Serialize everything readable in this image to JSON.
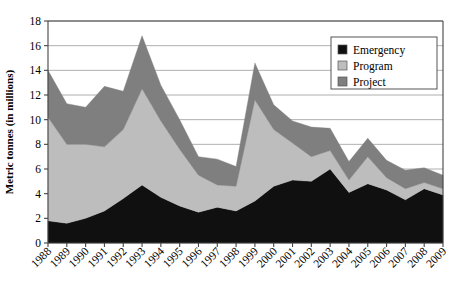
{
  "chart_data": {
    "type": "area",
    "stacked": true,
    "title": "",
    "xlabel": "",
    "ylabel": "Metric tonnes (in millions)",
    "ylim": [
      0,
      18
    ],
    "ytick_step": 2,
    "yticks": [
      "0",
      "2",
      "4",
      "6",
      "8",
      "10",
      "12",
      "14",
      "16",
      "18"
    ],
    "grid": true,
    "grid_axis": "y",
    "legend_position": "top-right",
    "categories": [
      "1988",
      "1989",
      "1990",
      "1991",
      "1992",
      "1993",
      "1994",
      "1995",
      "1996",
      "1997",
      "1998",
      "1999",
      "2000",
      "2001",
      "2002",
      "2003",
      "2004",
      "2005",
      "2006",
      "2007",
      "2008",
      "2009"
    ],
    "x": [
      "1988",
      "1989",
      "1990",
      "1991",
      "1992",
      "1993",
      "1994",
      "1995",
      "1996",
      "1997",
      "1998",
      "1999",
      "2000",
      "2001",
      "2002",
      "2003",
      "2004",
      "2005",
      "2006",
      "2007",
      "2008",
      "2009"
    ],
    "series": [
      {
        "name": "Emergency",
        "color": "#101010",
        "values": [
          1.8,
          1.6,
          2.0,
          2.6,
          3.6,
          4.7,
          3.7,
          3.0,
          2.5,
          2.9,
          2.6,
          3.4,
          4.6,
          5.1,
          5.0,
          6.0,
          4.1,
          4.8,
          4.3,
          3.5,
          4.4,
          3.9
        ]
      },
      {
        "name": "Program",
        "color": "#bdbdbd",
        "values": [
          8.4,
          6.4,
          6.0,
          5.2,
          5.6,
          7.8,
          6.2,
          4.6,
          3.0,
          1.8,
          2.0,
          8.2,
          4.6,
          3.0,
          2.0,
          1.5,
          1.0,
          2.2,
          1.0,
          0.9,
          0.5,
          0.5
        ]
      },
      {
        "name": "Project",
        "color": "#7f7f7f",
        "values": [
          3.8,
          3.3,
          3.0,
          4.9,
          3.1,
          4.3,
          2.9,
          2.4,
          1.5,
          2.1,
          1.6,
          3.0,
          2.0,
          1.8,
          2.4,
          1.8,
          1.5,
          1.5,
          1.4,
          1.5,
          1.2,
          1.1
        ]
      }
    ],
    "totals": [
      14.0,
      11.3,
      11.0,
      12.7,
      12.3,
      16.8,
      12.8,
      10.0,
      7.0,
      6.8,
      6.2,
      14.6,
      11.2,
      9.9,
      9.4,
      9.3,
      6.6,
      8.5,
      6.7,
      5.9,
      6.1,
      5.5
    ],
    "annotations": []
  },
  "legend": {
    "entries": [
      {
        "label": "Emergency",
        "swatch": "#101010"
      },
      {
        "label": "Program",
        "swatch": "#bdbdbd"
      },
      {
        "label": "Project",
        "swatch": "#7f7f7f"
      }
    ]
  },
  "axis": {
    "y_title": "Metric tonnes (in millions)"
  },
  "colors": {
    "emergency": "#101010",
    "program": "#bdbdbd",
    "project": "#7f7f7f",
    "grid": "#9a9a9a",
    "axis": "#444444",
    "background": "#ffffff"
  }
}
